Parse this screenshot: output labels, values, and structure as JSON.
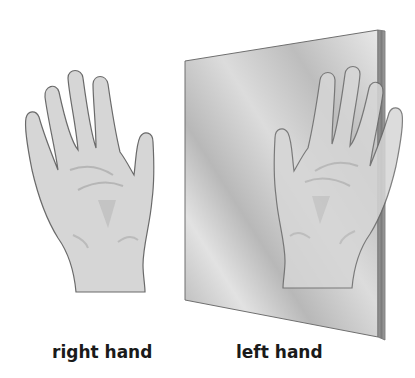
{
  "figure": {
    "labels": {
      "right_hand": "right hand",
      "left_hand": "left hand"
    },
    "colors": {
      "skin": "#d6d6d6",
      "outline": "#6a6a6a",
      "crease": "#a8a8a8",
      "mirror_light": "#e6e6e6",
      "mirror_dark": "#a9a9a9",
      "mirror_edge": "#8c8c8c"
    }
  }
}
